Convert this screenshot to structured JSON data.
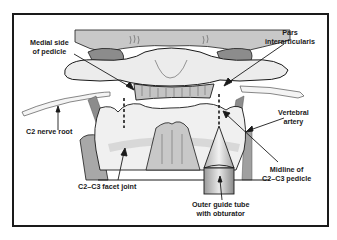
{
  "diagram": {
    "type": "anatomical-illustration",
    "labels": {
      "medial_side_of_pedicle": [
        "Medial side",
        "of pedicle"
      ],
      "pars_interarticularis": [
        "Pars",
        "interarticularis"
      ],
      "c2_nerve_root": "C2 nerve root",
      "vertebral_artery": [
        "Vertebral",
        "artery"
      ],
      "c2_c3_facet_joint": "C2–C3 facet joint",
      "midline_of_c2_c3_pedicle": [
        "Midline of",
        "C2–C3 pedicle"
      ],
      "outer_guide_tube": [
        "Outer guide tube",
        "with obturator"
      ]
    },
    "colors": {
      "frame": "#1a1a1a",
      "bone_light": "#ececec",
      "bone_mid": "#d4d4d4",
      "bone_dark": "#a8a8a8",
      "artery": "#8c8c8c",
      "outline": "#1a1a1a",
      "background": "#ffffff"
    }
  }
}
